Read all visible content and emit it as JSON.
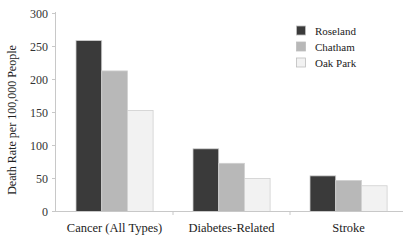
{
  "chart_data": {
    "type": "bar",
    "title": "",
    "xlabel": "",
    "ylabel": "Death Rate per 100,000 People",
    "ylim": [
      0,
      300
    ],
    "yticks": [
      0,
      50,
      100,
      150,
      200,
      250,
      300
    ],
    "grid": false,
    "legend_position": "upper right",
    "categories": [
      "Cancer (All Types)",
      "Diabetes-Related",
      "Stroke"
    ],
    "series": [
      {
        "name": "Roseland",
        "color": "#3a3a3a",
        "values": [
          259,
          95,
          54
        ]
      },
      {
        "name": "Chatham",
        "color": "#b8b8b8",
        "values": [
          213,
          73,
          47
        ]
      },
      {
        "name": "Oak Park",
        "color": "#f2f2f2",
        "values": [
          153,
          50,
          39
        ]
      }
    ]
  }
}
